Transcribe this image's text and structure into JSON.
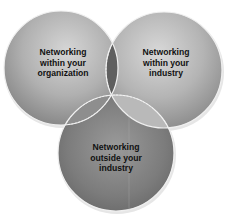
{
  "diagram": {
    "type": "venn",
    "circles": [
      {
        "id": "organization",
        "lines": [
          "Networking",
          "within your",
          "organization"
        ]
      },
      {
        "id": "industry",
        "lines": [
          "Networking",
          "within your",
          "industry"
        ]
      },
      {
        "id": "outside",
        "lines": [
          "Networking",
          "outside your",
          "industry"
        ]
      }
    ]
  },
  "colors": {
    "background": "#ffffff",
    "circle_light": "#d4d4d4",
    "circle_mid": "#a8a8a8",
    "circle_dark": "#7a7a7a",
    "overlap_dark": "#5e5e5e",
    "overlap_light": "#bdbdbd",
    "border": "#f2f2f2",
    "text": "#111111"
  }
}
